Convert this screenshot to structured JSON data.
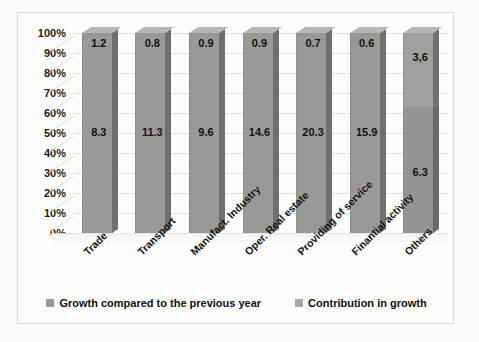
{
  "chart_data": {
    "type": "bar",
    "subtype": "100% stacked column (3-D)",
    "title": "",
    "xlabel": "",
    "ylabel": "",
    "ylim": [
      0,
      100
    ],
    "ytick_labels": [
      "100%",
      "90%",
      "80%",
      "70%",
      "60%",
      "50%",
      "40%",
      "30%",
      "20%",
      "10%",
      "0%"
    ],
    "ytick_values": [
      100,
      90,
      80,
      70,
      60,
      50,
      40,
      30,
      20,
      10,
      0
    ],
    "grid": true,
    "legend_position": "bottom",
    "categories": [
      "Trade",
      "Transport",
      "Manufact. Industry",
      "Oper. Real estate",
      "Providing of service",
      "Finantial activity",
      "Others"
    ],
    "series": [
      {
        "name": "Growth compared to the previous year",
        "color": "#a0a09d",
        "labels": [
          "1.2",
          "0.8",
          "0.9",
          "0.9",
          "0.7",
          "0.6",
          "3,6"
        ],
        "values": [
          1.2,
          0.8,
          0.9,
          0.9,
          0.7,
          0.6,
          3.6
        ]
      },
      {
        "name": "Contribution in growth",
        "color": "#949491",
        "labels": [
          "8.3",
          "11.3",
          "9.6",
          "14.6",
          "20.3",
          "15.9",
          "6.3"
        ],
        "values": [
          8.3,
          11.3,
          9.6,
          14.6,
          20.3,
          15.9,
          6.3
        ]
      }
    ],
    "bars": [
      {
        "category": "Trade",
        "top_label": "1.2",
        "bottom_label": "8.3",
        "top_fraction": 0.0,
        "split": false
      },
      {
        "category": "Transport",
        "top_label": "0.8",
        "bottom_label": "11.3",
        "top_fraction": 0.0,
        "split": false
      },
      {
        "category": "Manufact. Industry",
        "top_label": "0.9",
        "bottom_label": "9.6",
        "top_fraction": 0.0,
        "split": false
      },
      {
        "category": "Oper. Real estate",
        "top_label": "0.9",
        "bottom_label": "14.6",
        "top_fraction": 0.0,
        "split": false
      },
      {
        "category": "Providing of service",
        "top_label": "0.7",
        "bottom_label": "20.3",
        "top_fraction": 0.0,
        "split": false
      },
      {
        "category": "Finantial activity",
        "top_label": "0.6",
        "bottom_label": "15.9",
        "top_fraction": 0.0,
        "split": false
      },
      {
        "category": "Others",
        "top_label": "3,6",
        "bottom_label": "6.3",
        "top_fraction": 0.37,
        "split": true
      }
    ]
  },
  "legend": {
    "items": [
      {
        "label": "Growth compared to the previous year",
        "color": "#9a9a97"
      },
      {
        "label": "Contribution in growth",
        "color": "#a8a8a5"
      }
    ]
  }
}
